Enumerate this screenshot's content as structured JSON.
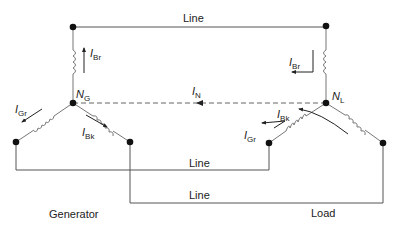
{
  "diagram": {
    "type": "three-phase wye-wye circuit",
    "colors": {
      "line": "#555555",
      "node": "#111111",
      "text": "#222222",
      "neutral": "#666666"
    },
    "line_labels": [
      "Line",
      "Line",
      "Line"
    ],
    "generator": {
      "label": "Generator",
      "neutral_label": {
        "main": "N",
        "sub": "G"
      },
      "currents": [
        {
          "main": "I",
          "sub": "Br"
        },
        {
          "main": "I",
          "sub": "Gr"
        },
        {
          "main": "I",
          "sub": "Bk"
        }
      ]
    },
    "load": {
      "label": "Load",
      "neutral_label": {
        "main": "N",
        "sub": "L"
      },
      "currents": [
        {
          "main": "I",
          "sub": "Br"
        },
        {
          "main": "I",
          "sub": "Bk"
        },
        {
          "main": "I",
          "sub": "Gr"
        }
      ]
    },
    "neutral_current": {
      "main": "I",
      "sub": "N"
    }
  }
}
